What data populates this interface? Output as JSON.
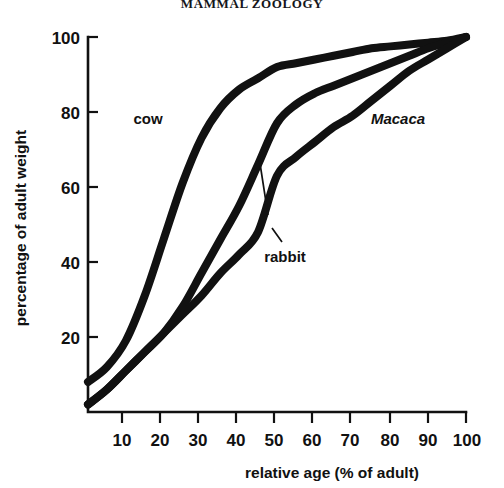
{
  "page": {
    "running_head": "MAMMAL ZOOLOGY"
  },
  "chart_data": {
    "type": "line",
    "title": "",
    "xlabel": "relative age (% of adult)",
    "ylabel": "percentage of adult weight",
    "xlim": [
      0,
      105
    ],
    "ylim": [
      0,
      105
    ],
    "xticks": [
      10,
      20,
      30,
      40,
      50,
      60,
      70,
      80,
      90,
      100
    ],
    "xtick_labels": [
      "10",
      "20",
      "30",
      "40",
      "50",
      "60",
      "70",
      "80",
      "90",
      "100"
    ],
    "yticks": [
      20,
      40,
      60,
      80,
      100
    ],
    "ytick_labels": [
      "20",
      "40",
      "60",
      "80",
      "100"
    ],
    "grid": false,
    "legend_position": "inline-annotations",
    "x": [
      0,
      5,
      10,
      15,
      20,
      25,
      30,
      35,
      40,
      45,
      50,
      55,
      60,
      65,
      70,
      75,
      80,
      85,
      90,
      95,
      100
    ],
    "series": [
      {
        "name": "cow",
        "label": "cow",
        "label_style": "roman",
        "values": [
          8,
          12,
          19,
          31,
          46,
          61,
          73,
          81,
          86,
          89,
          92,
          93,
          94,
          95,
          96,
          97,
          97.5,
          98,
          98.5,
          99,
          100
        ]
      },
      {
        "name": "rabbit",
        "label": "rabbit",
        "label_style": "roman",
        "values": [
          2,
          6,
          11,
          16,
          21,
          28,
          37,
          46,
          55,
          66,
          77,
          82,
          85,
          87,
          89,
          91,
          93,
          95,
          97,
          98.5,
          100
        ]
      },
      {
        "name": "Macaca",
        "label": "Macaca",
        "label_style": "italic",
        "values": [
          2,
          6,
          11,
          16,
          21,
          26,
          31,
          37,
          42,
          48,
          63,
          68,
          72,
          76,
          79,
          83,
          87,
          91,
          94,
          97,
          100
        ]
      }
    ],
    "annotations": [
      {
        "text": "cow",
        "x": 10,
        "y": 79,
        "style": "roman",
        "leader": false
      },
      {
        "text": "Macaca",
        "x": 76,
        "y": 79,
        "style": "italic",
        "leader": false
      },
      {
        "text": "rabbit",
        "x": 46,
        "y": 46,
        "style": "roman",
        "leader": true,
        "points_to_x": 43,
        "points_to_y": 63
      }
    ]
  }
}
